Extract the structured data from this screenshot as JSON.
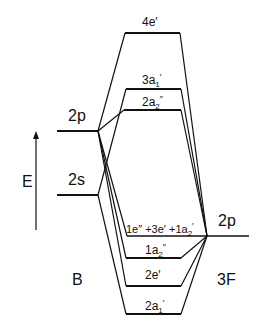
{
  "diagram": {
    "title": "",
    "axis": {
      "label": "E",
      "direction": "up"
    },
    "left_atom": {
      "name": "B",
      "orbitals": [
        "2p",
        "2s"
      ]
    },
    "right_atom": {
      "name": "3F",
      "orbitals": [
        "2p"
      ]
    },
    "mo_levels": [
      {
        "id": "4e'",
        "text": "4e′"
      },
      {
        "id": "3a1'",
        "text": "3a1′"
      },
      {
        "id": "2a2''",
        "text": "2a2″"
      },
      {
        "id": "nonbonding",
        "text": "1e″+3e′+1a2′"
      },
      {
        "id": "1a2''",
        "text": "1a2″"
      },
      {
        "id": "2e'",
        "text": "2e′"
      },
      {
        "id": "2a1'",
        "text": "2a1′"
      }
    ]
  },
  "labels": {
    "E": "E",
    "B": "B",
    "F3": "3F",
    "B_2p": "2p",
    "B_2s": "2s",
    "F_2p": "2p",
    "mo_4e": "4e′",
    "mo_3a1_main": "3a",
    "mo_3a1_sub": "1",
    "mo_3a1_prime": "′",
    "mo_2a2_main": "2a",
    "mo_2a2_sub": "2",
    "mo_2a2_prime": "″",
    "mo_nb_part1": "1e″ +3e′ +1a",
    "mo_nb_sub": "2",
    "mo_nb_prime": "′",
    "mo_1a2_main": "1a",
    "mo_1a2_sub": "2",
    "mo_1a2_prime": "″",
    "mo_2e": "2e′",
    "mo_2a1_main": "2a",
    "mo_2a1_sub": "1",
    "mo_2a1_prime": "′"
  }
}
